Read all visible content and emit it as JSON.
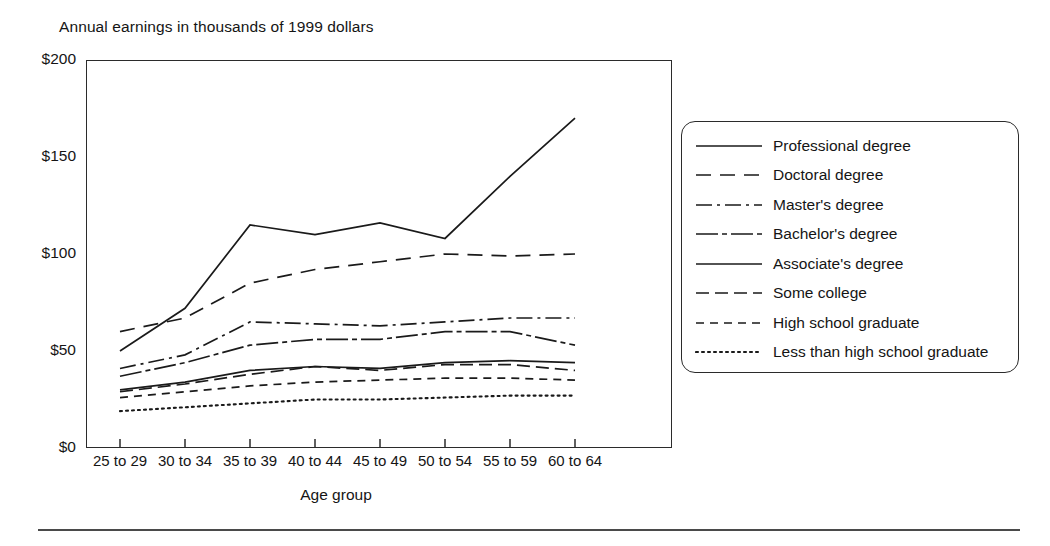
{
  "chart_data": {
    "type": "line",
    "title": "Annual earnings in thousands of 1999 dollars",
    "xlabel": "Age group",
    "ylabel": "",
    "grid": false,
    "legend_position": "right",
    "categories": [
      "25 to 29",
      "30 to 34",
      "35 to 39",
      "40 to 44",
      "45 to 49",
      "50 to 54",
      "55 to 59",
      "60 to 64"
    ],
    "ylim": [
      0,
      200
    ],
    "yticks": [
      0,
      50,
      100,
      150,
      200
    ],
    "ytick_labels": [
      "$0",
      "$50",
      "$100",
      "$150",
      "$200"
    ],
    "series": [
      {
        "name": "Professional degree",
        "dash": "solid",
        "values": [
          50,
          72,
          115,
          110,
          116,
          108,
          140,
          170
        ]
      },
      {
        "name": "Doctoral degree",
        "dash": "long-dash",
        "values": [
          60,
          67,
          85,
          92,
          96,
          100,
          99,
          100
        ]
      },
      {
        "name": "Master's degree",
        "dash": "dash-dot",
        "values": [
          41,
          48,
          65,
          64,
          63,
          65,
          67,
          67
        ]
      },
      {
        "name": "Bachelor's degree",
        "dash": "long-dash-short",
        "values": [
          37,
          44,
          53,
          56,
          56,
          60,
          60,
          53
        ]
      },
      {
        "name": "Associate's degree",
        "dash": "solid",
        "values": [
          30,
          34,
          40,
          42,
          41,
          44,
          45,
          44
        ]
      },
      {
        "name": "Some college",
        "dash": "medium-dash",
        "values": [
          29,
          33,
          38,
          42,
          40,
          43,
          43,
          40
        ]
      },
      {
        "name": "High school graduate",
        "dash": "short-dash",
        "values": [
          26,
          29,
          32,
          34,
          35,
          36,
          36,
          35
        ]
      },
      {
        "name": "Less than high school graduate",
        "dash": "dotted",
        "values": [
          19,
          21,
          23,
          25,
          25,
          26,
          27,
          27
        ]
      }
    ]
  },
  "legend": {
    "items": [
      {
        "label": "Professional degree",
        "swatch": "solid-line-swatch"
      },
      {
        "label": "Doctoral degree",
        "swatch": "long-dash-line-swatch"
      },
      {
        "label": "Master's degree",
        "swatch": "dash-dot-line-swatch"
      },
      {
        "label": "Bachelor's degree",
        "swatch": "long-dash-short-line-swatch"
      },
      {
        "label": "Associate's degree",
        "swatch": "solid-line-swatch"
      },
      {
        "label": "Some college",
        "swatch": "medium-dash-line-swatch"
      },
      {
        "label": "High school graduate",
        "swatch": "short-dash-line-swatch"
      },
      {
        "label": "Less than high school graduate",
        "swatch": "dotted-line-swatch"
      }
    ]
  },
  "colors": {
    "ink": "#1a1a1a",
    "frame": "#2b2b2b",
    "rule": "#4a4a4a",
    "background": "#ffffff"
  }
}
